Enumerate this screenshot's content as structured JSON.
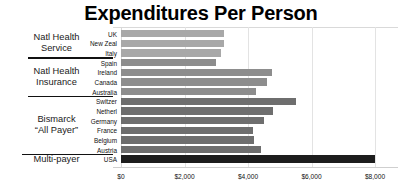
{
  "chart": {
    "title": "Expenditures Per Person",
    "type": "bar-horizontal"
  },
  "axis": {
    "ticks": [
      "$0",
      "$2,000",
      "$4,000",
      "$6,000",
      "$8,000"
    ],
    "tick_values": [
      0,
      2000,
      4000,
      6000,
      8000
    ],
    "xlabel": "",
    "ylabel": ""
  },
  "groups": [
    {
      "label": "Natl Health\nService",
      "line1": "Natl Health",
      "line2": "Service"
    },
    {
      "label": "Natl Health\nInsurance",
      "line1": "Natl Health",
      "line2": "Insurance"
    },
    {
      "label": "Bismarck\n“All Payer”",
      "line1": "Bismarck",
      "line2": "“All Payer”"
    },
    {
      "label": "Multi-payer",
      "line1": "Multi-payer",
      "line2": ""
    }
  ],
  "rows": [
    {
      "country": "UK",
      "value": 3250,
      "group": 0,
      "shade": "light"
    },
    {
      "country": "New Zeal",
      "value": 3250,
      "group": 0,
      "shade": "light"
    },
    {
      "country": "Italy",
      "value": 3150,
      "group": 0,
      "shade": "light"
    },
    {
      "country": "Spain",
      "value": 3000,
      "group": 1,
      "shade": "mid"
    },
    {
      "country": "Ireland",
      "value": 4750,
      "group": 1,
      "shade": "mid"
    },
    {
      "country": "Canada",
      "value": 4600,
      "group": 1,
      "shade": "mid"
    },
    {
      "country": "Australia",
      "value": 4250,
      "group": 1,
      "shade": "mid"
    },
    {
      "country": "Switzer",
      "value": 5500,
      "group": 2,
      "shade": "dark"
    },
    {
      "country": "Netherl",
      "value": 4800,
      "group": 2,
      "shade": "dark"
    },
    {
      "country": "Germany",
      "value": 4500,
      "group": 2,
      "shade": "dark"
    },
    {
      "country": "France",
      "value": 4150,
      "group": 2,
      "shade": "dark"
    },
    {
      "country": "Belgium",
      "value": 4200,
      "group": 2,
      "shade": "dark"
    },
    {
      "country": "Austria",
      "value": 4400,
      "group": 2,
      "shade": "dark"
    },
    {
      "country": "USA",
      "value": 8000,
      "group": 3,
      "shade": "black"
    }
  ],
  "chart_data": {
    "type": "bar",
    "title": "Expenditures Per Person",
    "xlabel": "",
    "ylabel": "",
    "orientation": "horizontal",
    "xlim": [
      0,
      8400
    ],
    "grid": true,
    "legend": "none",
    "categories": [
      "UK",
      "New Zeal",
      "Italy",
      "Spain",
      "Ireland",
      "Canada",
      "Australia",
      "Switzer",
      "Netherl",
      "Germany",
      "France",
      "Belgium",
      "Austria",
      "USA"
    ],
    "values": [
      3250,
      3250,
      3150,
      3000,
      4750,
      4600,
      4250,
      5500,
      4800,
      4500,
      4150,
      4200,
      4400,
      8000
    ],
    "xticks": [
      0,
      2000,
      4000,
      6000,
      8000
    ],
    "xticklabels": [
      "$0",
      "$2,000",
      "$4,000",
      "$6,000",
      "$8,000"
    ],
    "group_labels": [
      "Natl Health Service",
      "Natl Health Insurance",
      "Bismarck “All Payer”",
      "Multi-payer"
    ],
    "group_membership": [
      0,
      0,
      0,
      1,
      1,
      1,
      1,
      2,
      2,
      2,
      2,
      2,
      2,
      3
    ],
    "colors": {
      "light": "#a8a8a8",
      "mid": "#8d8d8d",
      "dark": "#6e6e6e",
      "black": "#1d1d1d"
    }
  }
}
